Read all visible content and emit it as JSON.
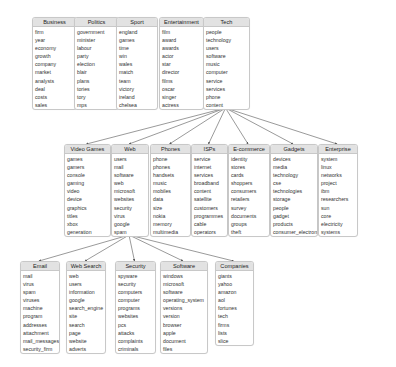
{
  "diagram": {
    "type": "topic-hierarchy",
    "colors": {
      "header_bg": "#e2e2e2",
      "border": "#c8c8c8",
      "edge": "#555555",
      "text": "#333333"
    },
    "nodes": [
      {
        "id": "business",
        "title": "Business",
        "x": 32,
        "y": 17,
        "w": 43,
        "words": [
          "firm",
          "year",
          "economy",
          "growth",
          "company",
          "market",
          "analysts",
          "deal",
          "costs",
          "sales"
        ]
      },
      {
        "id": "politics",
        "title": "Politics",
        "x": 74,
        "y": 17,
        "w": 43,
        "words": [
          "government",
          "minister",
          "labour",
          "party",
          "election",
          "blair",
          "plans",
          "tories",
          "tory",
          "mps"
        ]
      },
      {
        "id": "sport",
        "title": "Sport",
        "x": 116,
        "y": 17,
        "w": 40,
        "words": [
          "england",
          "games",
          "time",
          "win",
          "wales",
          "match",
          "team",
          "victory",
          "ireland",
          "chelsea"
        ]
      },
      {
        "id": "entertainment",
        "title": "Entertainment",
        "x": 159,
        "y": 17,
        "w": 43,
        "words": [
          "film",
          "award",
          "awards",
          "actor",
          "star",
          "director",
          "films",
          "oscar",
          "singer",
          "actress"
        ]
      },
      {
        "id": "tech",
        "title": "Tech",
        "x": 203,
        "y": 17,
        "w": 45,
        "words": [
          "people",
          "technology",
          "users",
          "software",
          "music",
          "computer",
          "service",
          "services",
          "phone",
          "content"
        ]
      },
      {
        "id": "video_games",
        "title": "Video Games",
        "x": 64,
        "y": 144,
        "w": 45,
        "words": [
          "games",
          "gamers",
          "console",
          "gaming",
          "video",
          "device",
          "graphics",
          "titles",
          "xbox",
          "generation"
        ]
      },
      {
        "id": "web",
        "title": "Web",
        "x": 111,
        "y": 144,
        "w": 36,
        "words": [
          "users",
          "mail",
          "software",
          "web",
          "microsoft",
          "websites",
          "security",
          "virus",
          "google",
          "spam"
        ]
      },
      {
        "id": "phones",
        "title": "Phones",
        "x": 150,
        "y": 144,
        "w": 39,
        "words": [
          "phone",
          "phones",
          "handsets",
          "music",
          "mobiles",
          "data",
          "size",
          "nokia",
          "memory",
          "multimedia"
        ]
      },
      {
        "id": "isps",
        "title": "ISPs",
        "x": 191,
        "y": 144,
        "w": 35,
        "words": [
          "service",
          "internet",
          "services",
          "broadband",
          "content",
          "satellite",
          "customers",
          "programmes",
          "cable",
          "operators"
        ]
      },
      {
        "id": "ecommerce",
        "title": "E-commerce",
        "x": 228,
        "y": 144,
        "w": 40,
        "words": [
          "identity",
          "stores",
          "cards",
          "shoppers",
          "consumers",
          "retailers",
          "survey",
          "documents",
          "groups",
          "theft"
        ]
      },
      {
        "id": "gadgets",
        "title": "Gadgets",
        "x": 270,
        "y": 144,
        "w": 46,
        "words": [
          "devices",
          "media",
          "technology",
          "cse",
          "technologies",
          "storage",
          "people",
          "gadget",
          "products",
          "consumer_electronics"
        ]
      },
      {
        "id": "enterprise",
        "title": "Enterprise",
        "x": 318,
        "y": 144,
        "w": 38,
        "words": [
          "system",
          "linux",
          "networks",
          "project",
          "ibm",
          "researchers",
          "sun",
          "core",
          "electricity",
          "systems"
        ]
      },
      {
        "id": "email",
        "title": "Email",
        "x": 20,
        "y": 261,
        "w": 38,
        "words": [
          "mail",
          "virus",
          "spam",
          "viruses",
          "machine",
          "program",
          "addresses",
          "attachment",
          "mail_messages",
          "security_firm"
        ]
      },
      {
        "id": "web_search",
        "title": "Web Search",
        "x": 66,
        "y": 261,
        "w": 38,
        "words": [
          "web",
          "users",
          "information",
          "google",
          "search_engine",
          "site",
          "search",
          "page",
          "website",
          "adverts"
        ]
      },
      {
        "id": "security",
        "title": "Security",
        "x": 115,
        "y": 261,
        "w": 39,
        "words": [
          "spyware",
          "security",
          "computers",
          "computer",
          "programs",
          "websites",
          "pcs",
          "attacks",
          "complaints",
          "criminals"
        ]
      },
      {
        "id": "software",
        "title": "Software",
        "x": 160,
        "y": 261,
        "w": 46,
        "words": [
          "windows",
          "microsoft",
          "software",
          "operating_system",
          "versions",
          "version",
          "browser",
          "apple",
          "document",
          "files"
        ]
      },
      {
        "id": "companies",
        "title": "Companies",
        "x": 215,
        "y": 261,
        "w": 37,
        "words": [
          "giants",
          "yahoo",
          "amazon",
          "aol",
          "fortunes",
          "tech",
          "firms",
          "lists",
          "slice"
        ]
      }
    ],
    "edges": [
      {
        "from": "tech",
        "to": "video_games"
      },
      {
        "from": "tech",
        "to": "web"
      },
      {
        "from": "tech",
        "to": "phones"
      },
      {
        "from": "tech",
        "to": "isps"
      },
      {
        "from": "tech",
        "to": "ecommerce"
      },
      {
        "from": "tech",
        "to": "gadgets"
      },
      {
        "from": "tech",
        "to": "enterprise"
      },
      {
        "from": "web",
        "to": "email"
      },
      {
        "from": "web",
        "to": "web_search"
      },
      {
        "from": "web",
        "to": "security"
      },
      {
        "from": "web",
        "to": "software"
      },
      {
        "from": "web",
        "to": "companies"
      }
    ]
  }
}
